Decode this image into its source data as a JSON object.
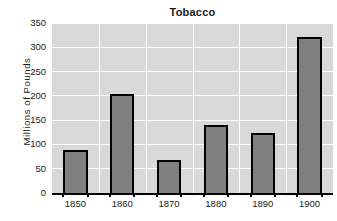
{
  "chart_data": {
    "type": "bar",
    "title": "Tobacco",
    "xlabel": "",
    "ylabel": "Millions of Pounds",
    "categories": [
      "1850",
      "1860",
      "1870",
      "1880",
      "1890",
      "1900"
    ],
    "values": [
      88,
      204,
      68,
      140,
      123,
      322
    ],
    "ylim": [
      0,
      350
    ],
    "yticks": [
      "0",
      "50",
      "100",
      "150",
      "200",
      "250",
      "300",
      "350"
    ],
    "ytick_values": [
      0,
      50,
      100,
      150,
      200,
      250,
      300,
      350
    ],
    "grid": "horizontal-and-vertical",
    "legend": "none",
    "colors": {
      "bar_fill": "#808080",
      "bar_edge": "#000000",
      "plot_background": "#d8d8d8",
      "gridline": "#ffffff",
      "text": "#1a1a1a",
      "figure_background": "#ffffff"
    }
  }
}
